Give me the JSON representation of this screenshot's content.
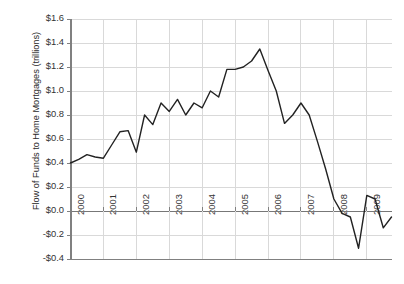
{
  "chart_data": {
    "type": "line",
    "title": "",
    "xlabel": "",
    "ylabel": "Flow of Funds to Home Mortgages (trillions)",
    "ylim": [
      -0.4,
      1.6
    ],
    "xlim": [
      2000,
      2009.75
    ],
    "grid": true,
    "legend": false,
    "y_tick_labels": [
      "$1.6",
      "$1.4",
      "$1.2",
      "$1.0",
      "$0.8",
      "$0.6",
      "$0.4",
      "$0.2",
      "$0.0",
      "-$0.2",
      "-$0.4"
    ],
    "y_tick_values": [
      1.6,
      1.4,
      1.2,
      1.0,
      0.8,
      0.6,
      0.4,
      0.2,
      0.0,
      -0.2,
      -0.4
    ],
    "x_tick_labels": [
      "2000",
      "2001",
      "2002",
      "2003",
      "2004",
      "2005",
      "2006",
      "2007",
      "2008",
      "2009"
    ],
    "x_tick_values": [
      2000,
      2001,
      2002,
      2003,
      2004,
      2005,
      2006,
      2007,
      2008,
      2009
    ],
    "series": [
      {
        "name": "Flow of Funds to Home Mortgages",
        "color": "#222222",
        "x": [
          2000.0,
          2000.25,
          2000.5,
          2000.75,
          2001.0,
          2001.25,
          2001.5,
          2001.75,
          2002.0,
          2002.25,
          2002.5,
          2002.75,
          2003.0,
          2003.25,
          2003.5,
          2003.75,
          2004.0,
          2004.25,
          2004.5,
          2004.75,
          2005.0,
          2005.25,
          2005.5,
          2005.75,
          2006.0,
          2006.25,
          2006.5,
          2006.75,
          2007.0,
          2007.25,
          2007.5,
          2007.75,
          2008.0,
          2008.25,
          2008.5,
          2008.75,
          2009.0,
          2009.25,
          2009.5,
          2009.75
        ],
        "y": [
          0.4,
          0.43,
          0.47,
          0.45,
          0.44,
          0.55,
          0.66,
          0.67,
          0.49,
          0.8,
          0.72,
          0.9,
          0.83,
          0.93,
          0.8,
          0.9,
          0.86,
          1.0,
          0.95,
          1.18,
          1.18,
          1.2,
          1.25,
          1.35,
          1.17,
          1.0,
          0.73,
          0.8,
          0.9,
          0.8,
          0.58,
          0.35,
          0.1,
          -0.02,
          -0.05,
          -0.31,
          0.13,
          0.1,
          -0.14,
          -0.05
        ]
      }
    ]
  },
  "axes": {
    "y_title": "Flow of Funds to Home Mortgages (trillions)"
  },
  "style": {
    "line_color": "#222222",
    "grid_color": "#d9d9d9",
    "axis_color": "#808080",
    "zero_line_color": "#777777",
    "text_color": "#333333",
    "background": "#ffffff"
  }
}
